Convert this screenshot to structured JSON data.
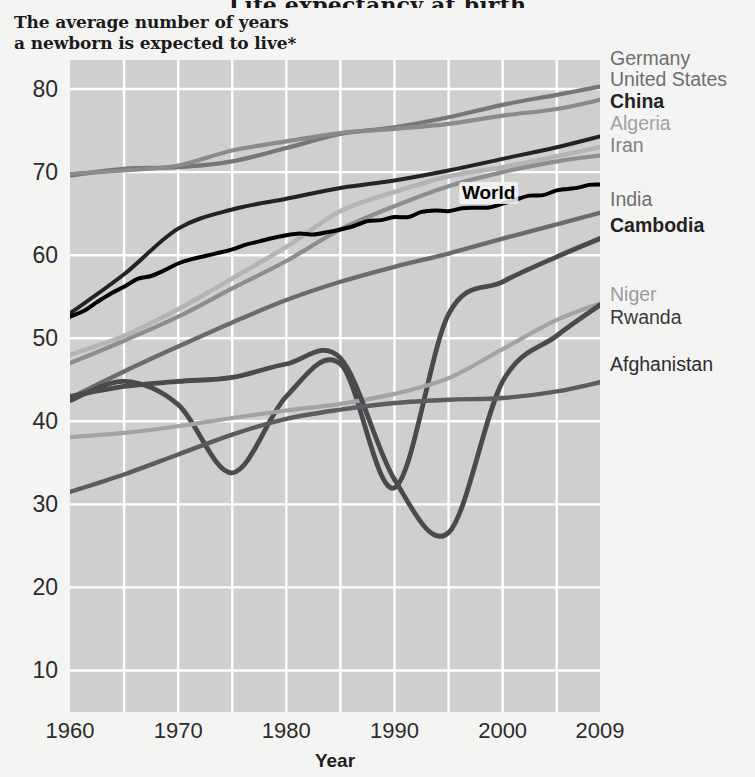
{
  "header": {
    "title": "Life expectancy at birth",
    "subtitle_line1": "The average number of years",
    "subtitle_line2": "a newborn is expected to live*"
  },
  "axes": {
    "xlabel": "Year",
    "ylabel": "",
    "ytick_labels": [
      "80",
      "70",
      "60",
      "50",
      "40",
      "30",
      "20",
      "10"
    ],
    "xtick_labels": [
      "1960",
      "1970",
      "1980",
      "1990",
      "2000",
      "2009"
    ],
    "grid": true
  },
  "inline_labels": [
    {
      "text": "World",
      "x": 2000.0,
      "y": 66.8
    }
  ],
  "legend": {
    "position": "right-outside",
    "entries": [
      {
        "label": "Germany",
        "color": "#6e6e70",
        "bold": false,
        "y": 58
      },
      {
        "label": "United States",
        "color": "#6e6e70",
        "bold": false,
        "y": 79
      },
      {
        "label": "China",
        "color": "#232325",
        "bold": true,
        "y": 101
      },
      {
        "label": "Algeria",
        "color": "#a0a0a2",
        "bold": false,
        "y": 123
      },
      {
        "label": "Iran",
        "color": "#808082",
        "bold": false,
        "y": 145
      },
      {
        "label": "India",
        "color": "#6e6e70",
        "bold": false,
        "y": 199
      },
      {
        "label": "Cambodia",
        "color": "#232325",
        "bold": true,
        "y": 225
      },
      {
        "label": "Niger",
        "color": "#9b9b9d",
        "bold": false,
        "y": 294
      },
      {
        "label": "Rwanda",
        "color": "#39393b",
        "bold": false,
        "y": 317
      },
      {
        "label": "Afghanistan",
        "color": "#2c2c2e",
        "bold": false,
        "y": 364
      }
    ]
  },
  "chart_data": {
    "type": "line",
    "title": "Life expectancy at birth",
    "subtitle": "The average number of years a newborn is expected to live*",
    "xlabel": "Year",
    "ylabel": "",
    "xlim": [
      1960,
      2009
    ],
    "ylim": [
      5,
      83.5
    ],
    "ytick_values": [
      80,
      70,
      60,
      50,
      40,
      30,
      20,
      10
    ],
    "xtick_values": [
      1960,
      1970,
      1980,
      1990,
      2000,
      2009
    ],
    "grid": true,
    "x": [
      1960,
      1965,
      1970,
      1975,
      1980,
      1985,
      1990,
      1995,
      2000,
      2005,
      2009
    ],
    "series": [
      {
        "name": "Germany",
        "color": "#75757a",
        "width": 4.2,
        "values": [
          69.6,
          70.4,
          70.6,
          71.3,
          72.9,
          74.6,
          75.4,
          76.6,
          78.1,
          79.3,
          80.3
        ]
      },
      {
        "name": "United States",
        "color": "#8a8a8e",
        "width": 4.2,
        "values": [
          69.8,
          70.2,
          70.8,
          72.6,
          73.7,
          74.7,
          75.2,
          75.8,
          76.8,
          77.6,
          78.7
        ]
      },
      {
        "name": "China",
        "color": "#232325",
        "width": 4.0,
        "values": [
          53.0,
          57.7,
          63.2,
          65.5,
          66.8,
          68.1,
          69.0,
          70.2,
          71.6,
          73.0,
          74.3
        ]
      },
      {
        "name": "Algeria",
        "color": "#b4b4b6",
        "width": 4.6,
        "values": [
          48.0,
          50.3,
          53.5,
          57.2,
          61.0,
          65.3,
          67.6,
          69.5,
          70.6,
          71.9,
          73.0
        ]
      },
      {
        "name": "Iran",
        "color": "#8d8d90",
        "width": 4.2,
        "values": [
          47.0,
          49.7,
          52.6,
          56.0,
          59.3,
          63.1,
          65.9,
          68.3,
          70.0,
          71.3,
          72.0
        ]
      },
      {
        "name": "World",
        "color": "#000000",
        "width": 4.0,
        "values": [
          52.6,
          56.2,
          59.0,
          60.7,
          62.4,
          63.1,
          64.6,
          65.3,
          66.2,
          67.8,
          68.5
        ]
      },
      {
        "name": "India",
        "color": "#6b6b6f",
        "width": 4.4,
        "values": [
          42.8,
          46.0,
          49.0,
          51.9,
          54.6,
          56.8,
          58.6,
          60.2,
          62.0,
          63.7,
          65.1
        ]
      },
      {
        "name": "Cambodia",
        "color": "#4a4a4e",
        "width": 4.8,
        "values": [
          42.5,
          44.8,
          42.0,
          33.8,
          43.0,
          46.9,
          32.0,
          52.9,
          56.8,
          59.8,
          62.0
        ]
      },
      {
        "name": "Niger",
        "color": "#a3a3a6",
        "width": 4.2,
        "values": [
          38.1,
          38.6,
          39.4,
          40.4,
          41.3,
          42.1,
          43.3,
          45.2,
          48.7,
          52.2,
          54.2
        ]
      },
      {
        "name": "Rwanda",
        "color": "#4a4a4e",
        "width": 4.8,
        "values": [
          43.0,
          44.2,
          44.8,
          45.3,
          46.9,
          47.6,
          33.0,
          26.6,
          44.8,
          50.3,
          54.0
        ]
      },
      {
        "name": "Afghanistan",
        "color": "#5c5c60",
        "width": 4.4,
        "values": [
          31.5,
          33.6,
          36.0,
          38.4,
          40.3,
          41.4,
          42.2,
          42.6,
          42.8,
          43.6,
          44.7
        ]
      }
    ],
    "annotations": [
      {
        "text": "World",
        "x": 2000,
        "y": 66.8
      }
    ]
  }
}
